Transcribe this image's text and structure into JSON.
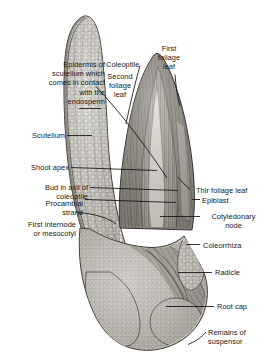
{
  "figure": {
    "width": 271,
    "height": 363,
    "background_color": "#ffffff",
    "line_color": "#111111",
    "text_color": "#161616",
    "tissue_tone_light": "#d9d7d2",
    "tissue_tone_mid": "#9b988f",
    "tissue_tone_dark": "#6b675f"
  },
  "labels": {
    "epidermis_of_scutellum": "Epidermis of\nscutellum which\ncomes in contact\nwith the\nendosperm",
    "scutellum": "Scutellum",
    "shoot_apex": "Shoot apex",
    "bud_in_axil": "Bud in axil of\ncoleoptile",
    "procambial_strand": "Procambial\nstrand",
    "first_internode": "First internode\nor mesocotyl",
    "coleoptile": "Coleoptile",
    "second_foliage_leaf": "Second\nfoliage\nleaf",
    "first_foliage_leaf": "First\nfoliage\nleaf",
    "third_foliage_leaf": "Thir foliage leaf",
    "epiblast": "Epiblast",
    "cotyledonary_node": "Cotyledonary\nnode",
    "coleorrhiza": "Coleorrhiza",
    "radicle": "Radicle",
    "root_cap": "Root cap",
    "remains_of_suspensor": "Remains of\nsuspensor"
  }
}
